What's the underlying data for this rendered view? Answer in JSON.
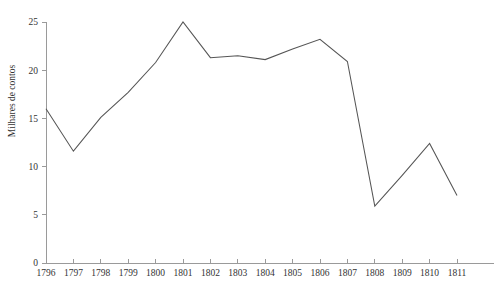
{
  "chart_data": {
    "type": "line",
    "title": "",
    "subtitle": "",
    "xlabel": "",
    "ylabel": "Milhares de contos",
    "categories": [
      "1796",
      "1797",
      "1798",
      "1799",
      "1800",
      "1801",
      "1802",
      "1803",
      "1804",
      "1805",
      "1806",
      "1807",
      "1808",
      "1809",
      "1810",
      "1811"
    ],
    "x": [
      1796,
      1797,
      1798,
      1799,
      1800,
      1801,
      1802,
      1803,
      1804,
      1805,
      1806,
      1807,
      1808,
      1809,
      1810,
      1811
    ],
    "values": [
      16.0,
      11.6,
      15.1,
      17.7,
      20.8,
      25.0,
      21.3,
      21.5,
      21.1,
      22.2,
      23.2,
      20.9,
      5.9,
      9.1,
      12.4,
      7.0
    ],
    "series": [
      {
        "name": "Milhares de contos",
        "values": [
          16.0,
          11.6,
          15.1,
          17.7,
          20.8,
          25.0,
          21.3,
          21.5,
          21.1,
          22.2,
          23.2,
          20.9,
          5.9,
          9.1,
          12.4,
          7.0
        ]
      }
    ],
    "ylim": [
      0,
      25
    ],
    "yticks": [
      0,
      5,
      10,
      15,
      20,
      25
    ],
    "ytick_labels": [
      "0",
      "5",
      "10",
      "15",
      "20",
      "25"
    ],
    "xlim": [
      1796,
      1811
    ],
    "grid": false,
    "legend": false,
    "legend_position": "none",
    "line_color": "#555555",
    "axis_color": "#9a9a9a",
    "background_color": "#ffffff",
    "text_color": "#333333"
  },
  "axes": {
    "y_title": "Milhares de contos"
  },
  "layout": {
    "plot_left": 46,
    "plot_right": 457,
    "plot_top": 22,
    "plot_bottom": 263
  }
}
